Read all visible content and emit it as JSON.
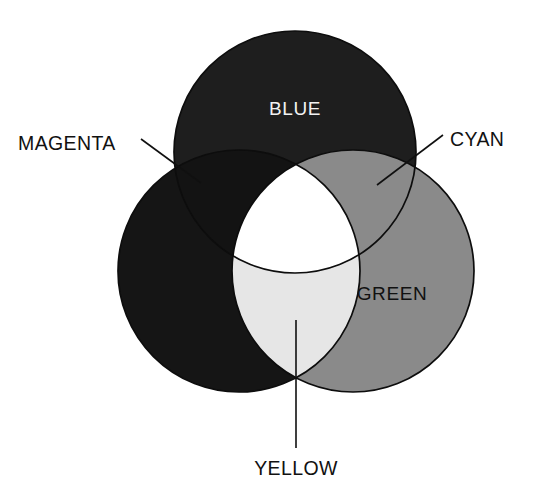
{
  "diagram": {
    "type": "venn-3-circle",
    "background_color": "#ffffff",
    "outline_color": "#0d0d0d",
    "circles": [
      {
        "id": "blue",
        "label": "BLUE",
        "position": "top",
        "cx": 295,
        "cy": 152,
        "r": 121,
        "fill": "#1e1e1e",
        "label_color": "#f2f2f2",
        "label_x": 295,
        "label_y": 115
      },
      {
        "id": "red",
        "label": "",
        "position": "bottom-left",
        "cx": 239,
        "cy": 271,
        "r": 121,
        "fill": "#151515",
        "label_color": "#f2f2f2",
        "label_x": 186,
        "label_y": 300
      },
      {
        "id": "green",
        "label": "GREEN",
        "position": "bottom-right",
        "cx": 353,
        "cy": 271,
        "r": 121,
        "fill": "#8a8a8a",
        "label_color": "#111111",
        "label_x": 392,
        "label_y": 300
      }
    ],
    "overlaps": [
      {
        "id": "magenta",
        "label": "MAGENTA",
        "components": [
          "red",
          "blue"
        ],
        "fill": "#131313"
      },
      {
        "id": "cyan",
        "label": "CYAN",
        "components": [
          "blue",
          "green"
        ],
        "fill": "#8a8a8a"
      },
      {
        "id": "yellow",
        "label": "YELLOW",
        "components": [
          "red",
          "green"
        ],
        "fill": "#e6e6e6"
      },
      {
        "id": "white-center",
        "label": "",
        "components": [
          "red",
          "green",
          "blue"
        ],
        "fill": "#ffffff"
      }
    ],
    "callouts": [
      {
        "id": "magenta",
        "label": "MAGENTA",
        "text_x": 18,
        "text_y": 150,
        "text_anchor": "start",
        "line_from": [
          141,
          139
        ],
        "line_to": [
          201,
          183
        ]
      },
      {
        "id": "cyan",
        "label": "CYAN",
        "text_x": 450,
        "text_y": 146,
        "text_anchor": "start",
        "line_from": [
          443,
          135
        ],
        "line_to": [
          377,
          185
        ]
      },
      {
        "id": "yellow",
        "label": "YELLOW",
        "text_x": 296,
        "text_y": 475,
        "text_anchor": "middle",
        "line_from": [
          296,
          448
        ],
        "line_to": [
          296,
          320
        ]
      }
    ]
  }
}
